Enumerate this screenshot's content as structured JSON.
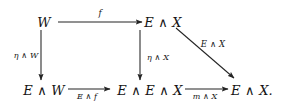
{
  "diagram": {
    "type": "commutative-diagram",
    "background_color": "#ffffff",
    "ink_color": "#141414",
    "nodes": [
      {
        "id": "top-left",
        "label": "W",
        "x": 44,
        "y": 22
      },
      {
        "id": "top-right",
        "label": "E ∧ X",
        "x": 163,
        "y": 22
      },
      {
        "id": "bottom-left",
        "label": "E ∧ W",
        "x": 44,
        "y": 90
      },
      {
        "id": "bottom-middle",
        "label": "E ∧ E ∧ X",
        "x": 150,
        "y": 90
      },
      {
        "id": "bottom-right",
        "label": "E ∧ X.",
        "x": 252,
        "y": 90
      }
    ],
    "edges": [
      {
        "id": "top-horizontal",
        "from": "top-left",
        "to": "top-right",
        "label": "f",
        "label_x": 100,
        "label_y": 13,
        "x1": 58,
        "y1": 22,
        "x2": 142,
        "y2": 22
      },
      {
        "id": "left-vertical",
        "from": "top-left",
        "to": "bottom-left",
        "label": "η ∧ W",
        "label_x": 26,
        "label_y": 56,
        "x1": 41,
        "y1": 30,
        "x2": 41,
        "y2": 80
      },
      {
        "id": "middle-vertical",
        "from": "top-right",
        "to": "bottom-middle",
        "label": "η ∧ X",
        "label_x": 158,
        "label_y": 58,
        "x1": 140,
        "y1": 30,
        "x2": 140,
        "y2": 80
      },
      {
        "id": "diagonal",
        "from": "top-right",
        "to": "bottom-right",
        "label": "E ∧ X",
        "label_x": 213,
        "label_y": 44,
        "x1": 176,
        "y1": 28,
        "x2": 234,
        "y2": 78
      },
      {
        "id": "bottom-left-horizontal",
        "from": "bottom-left",
        "to": "bottom-middle",
        "label": "E ∧ f",
        "label_x": 87,
        "label_y": 97,
        "x1": 68,
        "y1": 89,
        "x2": 110,
        "y2": 89
      },
      {
        "id": "bottom-right-horizontal",
        "from": "bottom-middle",
        "to": "bottom-right",
        "label": "m ∧ X",
        "label_x": 205,
        "label_y": 97,
        "x1": 185,
        "y1": 89,
        "x2": 228,
        "y2": 89
      }
    ]
  }
}
